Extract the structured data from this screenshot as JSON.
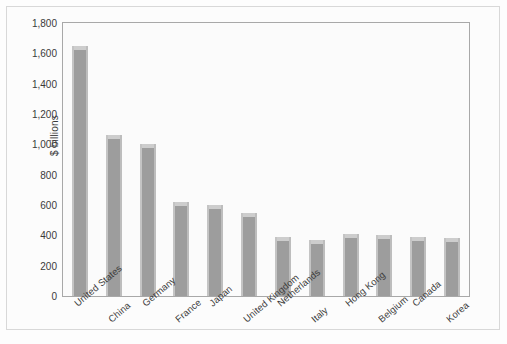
{
  "chart_data": {
    "type": "bar",
    "title": "",
    "xlabel": "",
    "ylabel": "$ billions",
    "ylim": [
      0,
      1800
    ],
    "ytick_step": 200,
    "grid": false,
    "legend": null,
    "categories": [
      "United States",
      "China",
      "Germany",
      "France",
      "Japan",
      "United Kingdom",
      "Netherlands",
      "Italy",
      "Hong Kong",
      "Belgium",
      "Canada",
      "Korea"
    ],
    "values": [
      1650,
      1060,
      1000,
      620,
      600,
      550,
      390,
      370,
      410,
      405,
      390,
      385
    ],
    "ytick_labels": [
      "0",
      "200",
      "400",
      "600",
      "800",
      "1,000",
      "1,200",
      "1,400",
      "1,600",
      "1,800"
    ],
    "ytick_values": [
      0,
      200,
      400,
      600,
      800,
      1000,
      1200,
      1400,
      1600,
      1800
    ],
    "colors": {
      "bar_fill": "#9d9d9d",
      "bar_top": "#cdcdcd",
      "axis": "#a8a8a8",
      "text": "#3a3a3a",
      "plot_background": "#fbfbfb",
      "figure_background": "#fcfcfc"
    }
  }
}
